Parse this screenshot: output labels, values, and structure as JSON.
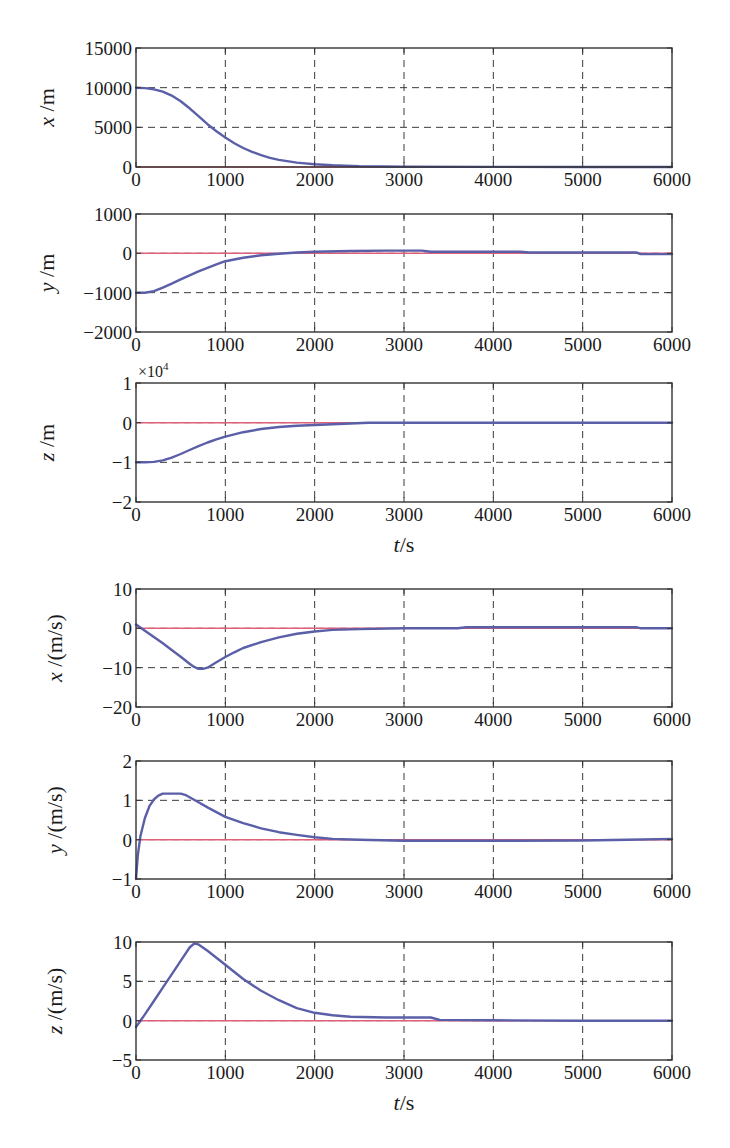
{
  "chart_data": [
    {
      "type": "line",
      "title": "",
      "xlabel": "",
      "ylabel": "x /m",
      "ylabel_parts": {
        "var": "x",
        "unit": " /m"
      },
      "xlim": [
        0,
        6000
      ],
      "ylim": [
        0,
        15000
      ],
      "xticks": [
        0,
        1000,
        2000,
        3000,
        4000,
        5000,
        6000
      ],
      "yticks": [
        0,
        5000,
        10000,
        15000
      ],
      "ytick_labels": [
        "0",
        "5000",
        "10000",
        "15000"
      ],
      "grid": true,
      "legend": null,
      "series": [
        {
          "name": "reference",
          "color": "#e0607a",
          "x": [
            0,
            6000
          ],
          "values": [
            0,
            0
          ]
        },
        {
          "name": "response",
          "color": "#5a5fa8",
          "x": [
            0,
            100,
            200,
            300,
            400,
            500,
            600,
            700,
            800,
            900,
            1000,
            1100,
            1200,
            1300,
            1400,
            1500,
            1600,
            1800,
            2000,
            2200,
            2500,
            3000,
            4000,
            5000,
            6000
          ],
          "values": [
            10000,
            9950,
            9800,
            9500,
            9000,
            8300,
            7400,
            6400,
            5400,
            4500,
            3700,
            3000,
            2400,
            1900,
            1500,
            1150,
            900,
            550,
            350,
            220,
            100,
            40,
            10,
            5,
            0
          ]
        }
      ]
    },
    {
      "type": "line",
      "title": "",
      "xlabel": "",
      "ylabel": "y /m",
      "ylabel_parts": {
        "var": "y",
        "unit": " /m"
      },
      "xlim": [
        0,
        6000
      ],
      "ylim": [
        -2000,
        1000
      ],
      "xticks": [
        0,
        1000,
        2000,
        3000,
        4000,
        5000,
        6000
      ],
      "yticks": [
        -2000,
        -1000,
        0,
        1000
      ],
      "ytick_labels": [
        "−2000",
        "−1000",
        "0",
        "1000"
      ],
      "grid": true,
      "legend": null,
      "series": [
        {
          "name": "reference",
          "color": "#e0607a",
          "x": [
            0,
            6000
          ],
          "values": [
            0,
            0
          ]
        },
        {
          "name": "response",
          "color": "#5a5fa8",
          "x": [
            0,
            100,
            200,
            300,
            400,
            500,
            600,
            700,
            800,
            900,
            1000,
            1200,
            1400,
            1600,
            1800,
            2000,
            2400,
            2800,
            3200,
            3300,
            4300,
            4400,
            5600,
            5650,
            6000
          ],
          "values": [
            -1000,
            -1000,
            -960,
            -870,
            -770,
            -660,
            -560,
            -460,
            -370,
            -280,
            -200,
            -110,
            -50,
            -10,
            20,
            40,
            60,
            70,
            70,
            40,
            40,
            20,
            20,
            -20,
            -20
          ]
        }
      ]
    },
    {
      "type": "line",
      "title": "",
      "xlabel": "t/s",
      "xlabel_parts": {
        "var": "t",
        "unit": "/s"
      },
      "ylabel": "z /m",
      "ylabel_parts": {
        "var": "z",
        "unit": " /m"
      },
      "y_exponent": "×10^4",
      "xlim": [
        0,
        6000
      ],
      "ylim": [
        -2,
        1
      ],
      "xticks": [
        0,
        1000,
        2000,
        3000,
        4000,
        5000,
        6000
      ],
      "yticks": [
        -2,
        -1,
        0,
        1
      ],
      "ytick_labels": [
        "−2",
        "−1",
        "0",
        "1"
      ],
      "grid": true,
      "legend": null,
      "series": [
        {
          "name": "reference",
          "color": "#e0607a",
          "x": [
            0,
            6000
          ],
          "values": [
            0,
            0
          ]
        },
        {
          "name": "response",
          "color": "#5a5fa8",
          "x": [
            0,
            100,
            200,
            300,
            400,
            500,
            600,
            700,
            800,
            900,
            1000,
            1200,
            1400,
            1600,
            1800,
            2000,
            2200,
            2400,
            2600,
            3000,
            4000,
            5000,
            6000
          ],
          "values": [
            -1.0,
            -1.0,
            -0.99,
            -0.95,
            -0.88,
            -0.79,
            -0.69,
            -0.59,
            -0.5,
            -0.42,
            -0.35,
            -0.24,
            -0.16,
            -0.11,
            -0.08,
            -0.06,
            -0.04,
            -0.02,
            0.0,
            0.0,
            0.0,
            0.0,
            0.0
          ]
        }
      ]
    },
    {
      "type": "line",
      "title": "",
      "xlabel": "",
      "ylabel": "ẋ /(m/s)",
      "ylabel_parts": {
        "var": "x",
        "unit": " /(m/s)"
      },
      "xlim": [
        0,
        6000
      ],
      "ylim": [
        -20,
        10
      ],
      "xticks": [
        0,
        1000,
        2000,
        3000,
        4000,
        5000,
        6000
      ],
      "yticks": [
        -20,
        -10,
        0,
        10
      ],
      "ytick_labels": [
        "−20",
        "−10",
        "0",
        "10"
      ],
      "grid": true,
      "legend": null,
      "series": [
        {
          "name": "reference",
          "color": "#e0607a",
          "x": [
            0,
            6000
          ],
          "values": [
            0,
            0
          ]
        },
        {
          "name": "response",
          "color": "#5a5fa8",
          "x": [
            0,
            100,
            200,
            300,
            400,
            500,
            600,
            650,
            700,
            750,
            800,
            900,
            1000,
            1100,
            1200,
            1400,
            1600,
            1800,
            2000,
            2200,
            2500,
            3000,
            3600,
            3700,
            5600,
            5650,
            6000
          ],
          "values": [
            1.0,
            -0.6,
            -2.2,
            -3.8,
            -5.5,
            -7.2,
            -9.0,
            -9.8,
            -10.3,
            -10.3,
            -10.0,
            -8.6,
            -7.3,
            -6.1,
            -5.0,
            -3.5,
            -2.3,
            -1.4,
            -0.8,
            -0.4,
            -0.2,
            0.0,
            0.0,
            0.3,
            0.3,
            0.0,
            0.0
          ]
        }
      ]
    },
    {
      "type": "line",
      "title": "",
      "xlabel": "",
      "ylabel": "ẏ /(m/s)",
      "ylabel_parts": {
        "var": "y",
        "unit": " /(m/s)"
      },
      "xlim": [
        0,
        6000
      ],
      "ylim": [
        -1,
        2
      ],
      "xticks": [
        0,
        1000,
        2000,
        3000,
        4000,
        5000,
        6000
      ],
      "yticks": [
        -1,
        0,
        1,
        2
      ],
      "ytick_labels": [
        "−1",
        "0",
        "1",
        "2"
      ],
      "grid": true,
      "legend": null,
      "series": [
        {
          "name": "reference",
          "color": "#e0607a",
          "x": [
            0,
            6000
          ],
          "values": [
            0,
            0
          ]
        },
        {
          "name": "response",
          "color": "#5a5fa8",
          "x": [
            0,
            20,
            50,
            100,
            150,
            200,
            250,
            300,
            400,
            500,
            550,
            600,
            700,
            800,
            900,
            1000,
            1200,
            1400,
            1600,
            1800,
            2000,
            2200,
            2500,
            3000,
            4000,
            5000,
            5500,
            6000
          ],
          "values": [
            -1.0,
            -0.4,
            0.1,
            0.55,
            0.85,
            1.02,
            1.12,
            1.17,
            1.17,
            1.17,
            1.14,
            1.08,
            0.95,
            0.82,
            0.7,
            0.58,
            0.42,
            0.29,
            0.19,
            0.12,
            0.06,
            0.02,
            0.0,
            -0.03,
            -0.03,
            -0.02,
            0.0,
            0.02
          ]
        }
      ]
    },
    {
      "type": "line",
      "title": "",
      "xlabel": "t/s",
      "xlabel_parts": {
        "var": "t",
        "unit": "/s"
      },
      "ylabel": "ż /(m/s)",
      "ylabel_parts": {
        "var": "z",
        "unit": " /(m/s)"
      },
      "xlim": [
        0,
        6000
      ],
      "ylim": [
        -5,
        10
      ],
      "xticks": [
        0,
        1000,
        2000,
        3000,
        4000,
        5000,
        6000
      ],
      "yticks": [
        -5,
        0,
        5,
        10
      ],
      "ytick_labels": [
        "−5",
        "0",
        "5",
        "10"
      ],
      "grid": true,
      "legend": null,
      "series": [
        {
          "name": "reference",
          "color": "#e0607a",
          "x": [
            0,
            6000
          ],
          "values": [
            0,
            0
          ]
        },
        {
          "name": "response",
          "color": "#5a5fa8",
          "x": [
            0,
            100,
            200,
            300,
            400,
            500,
            600,
            650,
            700,
            800,
            900,
            1000,
            1200,
            1400,
            1600,
            1800,
            2000,
            2200,
            2400,
            2800,
            3300,
            3400,
            4000,
            5000,
            6000
          ],
          "values": [
            -0.8,
            0.8,
            2.5,
            4.2,
            5.9,
            7.6,
            9.3,
            9.8,
            9.7,
            8.9,
            8.0,
            7.1,
            5.3,
            3.8,
            2.6,
            1.6,
            1.0,
            0.7,
            0.5,
            0.4,
            0.4,
            0.1,
            0.05,
            0.0,
            0.0
          ]
        }
      ]
    }
  ],
  "layout": {
    "plot_left": 136,
    "plot_right": 672,
    "panels": [
      {
        "top": 48,
        "bottom": 167,
        "show_xlabel": false
      },
      {
        "top": 214,
        "bottom": 332,
        "show_xlabel": false
      },
      {
        "top": 383,
        "bottom": 502,
        "show_xlabel": true,
        "xlabel_y": 552
      },
      {
        "top": 589,
        "bottom": 707,
        "show_xlabel": false
      },
      {
        "top": 761,
        "bottom": 879,
        "show_xlabel": false
      },
      {
        "top": 942,
        "bottom": 1060,
        "show_xlabel": true,
        "xlabel_y": 1110
      }
    ]
  }
}
